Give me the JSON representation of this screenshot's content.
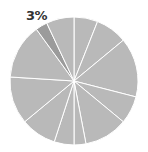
{
  "chart_data": {
    "type": "pie",
    "title": "",
    "start_angle_deg": 0,
    "direction": "clockwise",
    "values": [
      6,
      8,
      15,
      7,
      11,
      3,
      5,
      9,
      12,
      14,
      3,
      7
    ],
    "highlight_index": 10,
    "annotations": [
      {
        "text": "3%",
        "slice_index": 10
      }
    ],
    "colors": {
      "default": "#b9b9b9",
      "highlight": "#9b9b9b",
      "separator": "#ffffff"
    },
    "legend": null
  },
  "labels": {
    "highlight_label": "3%"
  }
}
